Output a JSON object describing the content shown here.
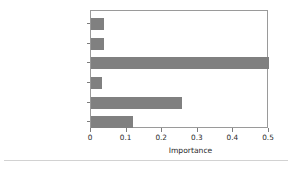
{
  "chart_data": {
    "type": "bar",
    "orientation": "horizontal",
    "title": "",
    "xlabel": "Importance",
    "ylabel": "",
    "xlim": [
      0,
      0.5
    ],
    "xticks": [
      "0",
      "0.1",
      "0.2",
      "0.3",
      "0.4",
      "0.5"
    ],
    "xtick_values": [
      0,
      0.1,
      0.2,
      0.3,
      0.4,
      0.5
    ],
    "grid": false,
    "legend": null,
    "bar_color": "#808080",
    "categories": [
      "tarmac_dry",
      "snow_road",
      "distance_to_object",
      "tire_width",
      "car_velocity",
      "car_weight"
    ],
    "values": [
      0.037,
      0.037,
      0.5,
      0.031,
      0.255,
      0.117
    ],
    "series": [
      {
        "name": "Importance",
        "values": [
          0.037,
          0.037,
          0.5,
          0.031,
          0.255,
          0.117
        ]
      }
    ]
  },
  "axes": {
    "x_axis_label": "Importance",
    "tick_labels": {
      "t0": "0",
      "t1": "0.1",
      "t2": "0.2",
      "t3": "0.3",
      "t4": "0.4",
      "t5": "0.5"
    }
  },
  "category_labels": {
    "c0": "tarmac_dry",
    "c1": "snow_road",
    "c2": "distance_to_object",
    "c3": "tire_width",
    "c4": "car_velocity",
    "c5": "car_weight"
  }
}
